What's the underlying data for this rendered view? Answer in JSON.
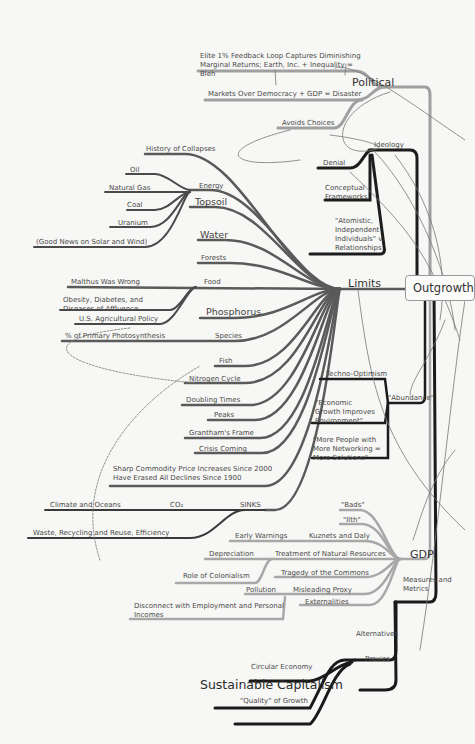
{
  "central": {
    "label": "Outgrowth"
  },
  "branches": {
    "political": {
      "label": "Political",
      "items": [
        "Elite 1% Feedback Loop Captures Diminishing Marginal Returns; Earth, Inc. + Inequality = Bleh",
        "Markets Over Democracy + GDP = Disaster",
        "Avoids Choices"
      ]
    },
    "ideology": {
      "label": "Ideology",
      "items": [
        "Denial",
        "Conceptual Frameworks",
        "\"Atomistic, Independent Individuals\" v. Relationships"
      ]
    },
    "limits": {
      "label": "Limits",
      "items": {
        "history": "History of Collapses",
        "energy": "Energy",
        "energy_sub": [
          "Oil",
          "Natural Gas",
          "Coal",
          "Uranium",
          "(Good News on Solar and Wind)"
        ],
        "topsoil": "Topsoil",
        "water": "Water",
        "forests": "Forests",
        "food": "Food",
        "food_sub": [
          "Malthus Was Wrong",
          "Obesity, Diabetes, and Diseases of Affluence",
          "U.S. Agricultural Policy"
        ],
        "phosphorus": "Phosphorus",
        "species": "Species",
        "species_sub": [
          "% of Primary Photosynthesis"
        ],
        "fish": "Fish",
        "nitrogen": "Nitrogen Cycle",
        "doubling": "Doubling Times",
        "peaks": "Peaks",
        "grantham": "Grantham's Frame",
        "crisis": "Crisis Coming",
        "commodity": "Sharp Commodity Price Increases Since 2000 Have Erased All Declines Since 1900",
        "sinks": "SINKS",
        "co2": "CO₂",
        "climate": "Climate and Oceans",
        "waste": "Waste, Recycling and Reuse, Efficiency"
      }
    },
    "abundance": {
      "label": "\"Abundance\"",
      "items": [
        "Techno-Optimism",
        "\"Economic Growth Improves Environment\"",
        "\"More People with More Networking = More Solutions\""
      ]
    },
    "gdp": {
      "label": "GDP",
      "items": {
        "bads": "\"Bads\"",
        "ilth": "\"Ilth\"",
        "kuznets": "Kuznets and Daly",
        "early": "Early Warnings",
        "treatment": "Treatment of Natural Resources",
        "depreciation": "Depreciation",
        "colonialism": "Role of Colonialism",
        "tragedy": "Tragedy of the Commons",
        "misleading": "Misleading Proxy",
        "pollution": "Pollution",
        "disconnect": "Disconnect with Employment and Personal Incomes",
        "externalities": "Externalities"
      }
    },
    "measures": {
      "label": "Measures and Metrics",
      "items": [
        "Alternatives",
        "Proxies"
      ]
    },
    "alternatives_sub": [
      "Circular Economy",
      "Sustainable Capitalism",
      "\"Quality\" of Growth"
    ]
  },
  "colors": {
    "dark_branch": "#1f1f1f",
    "mid_branch": "#555555",
    "light_branch": "#9a9a9a",
    "background": "#f7f7f5"
  }
}
